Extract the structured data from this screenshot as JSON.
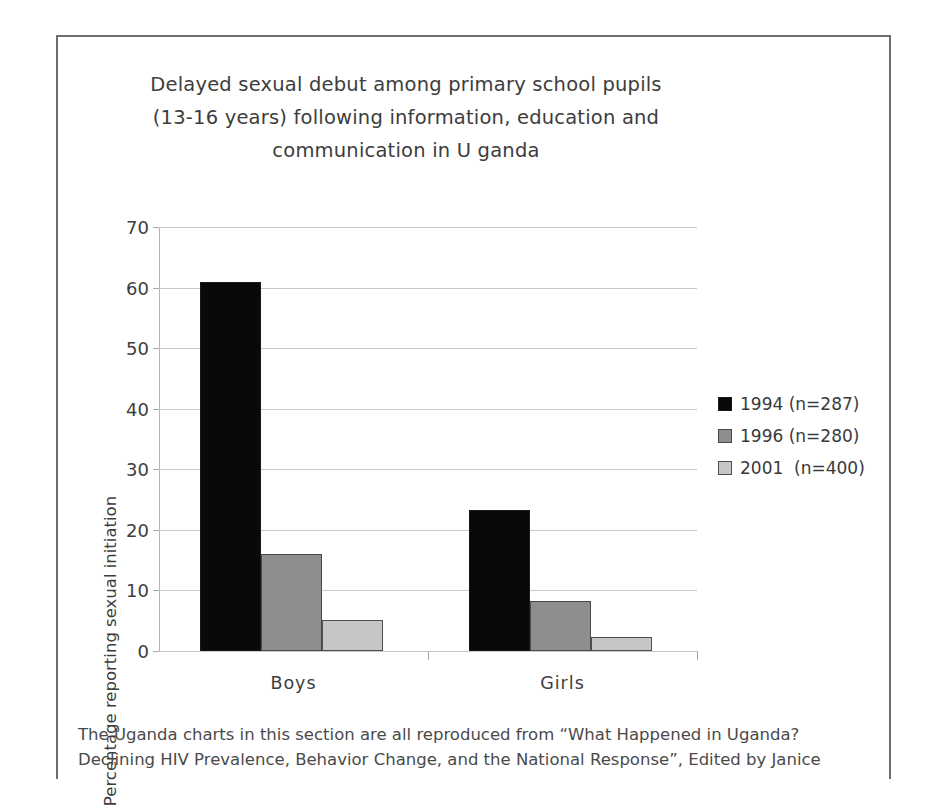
{
  "figure": {
    "title_lines": [
      "Delayed sexual debut among primary school pupils",
      "(13-16 years) following information, education and",
      "communication in U ganda"
    ],
    "caption_lines": [
      "The Uganda charts in this section are all reproduced from “What Happened in Uganda?",
      "Declining HIV Prevalence, Behavior Change, and the National Response”, Edited by Janice"
    ]
  },
  "chart_data": {
    "type": "bar",
    "xlabel": "",
    "ylabel": "Percentage reporting sexual initiation",
    "categories": [
      "Boys",
      "Girls"
    ],
    "ylim": [
      0,
      70
    ],
    "yticks": [
      0,
      10,
      20,
      30,
      40,
      50,
      60,
      70
    ],
    "ytick_labels": [
      "0",
      "10",
      "20",
      "30",
      "40",
      "50",
      "60",
      "70"
    ],
    "grid": true,
    "legend_position": "right",
    "series": [
      {
        "name": "1994 (n=287)",
        "label": "1994 (n=287)",
        "color": "#090909",
        "values": [
          61.0,
          23.3
        ]
      },
      {
        "name": "1996 (n=280)",
        "label": "1996 (n=280)",
        "color": "#8e8e8e",
        "values": [
          16.0,
          8.2
        ]
      },
      {
        "name": "2001  (n=400)",
        "label": "2001  (n=400)",
        "color": "#c6c6c6",
        "values": [
          5.2,
          2.3
        ]
      }
    ]
  }
}
